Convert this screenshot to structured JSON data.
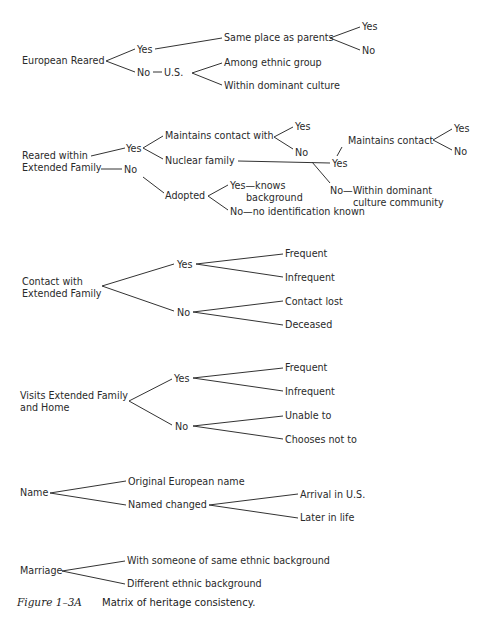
{
  "trees": {
    "european_reared": {
      "root": "European Reared",
      "yes": "Yes",
      "same_place": "Same place as parents",
      "same_place_yes": "Yes",
      "same_place_no": "No",
      "no": "No",
      "us": "U.S.",
      "among_ethnic": "Among ethnic group",
      "within_dominant": "Within dominant culture"
    },
    "extended_family": {
      "root_line1": "Reared  within",
      "root_line2": "Extended Family",
      "yes": "Yes",
      "maintains_contact_with": "Maintains contact with",
      "mcw_yes": "Yes",
      "mcw_no": "No",
      "nuclear_family": "Nuclear family",
      "nf_yes": "Yes",
      "maintains_contact": "Maintains contact",
      "mc_yes": "Yes",
      "mc_no": "No",
      "nf_no_line1": "No—Within dominant",
      "nf_no_line2": "culture community",
      "no": "No",
      "adopted": "Adopted",
      "adopted_yes_line1": "Yes—knows",
      "adopted_yes_line2": "background",
      "adopted_no": "No—no identification known"
    },
    "contact": {
      "root_line1": "Contact with",
      "root_line2": "Extended Family",
      "yes": "Yes",
      "frequent": "Frequent",
      "infrequent": "Infrequent",
      "no": "No",
      "contact_lost": "Contact lost",
      "deceased": "Deceased"
    },
    "visits": {
      "root_line1": "Visits Extended Family",
      "root_line2": "and Home",
      "yes": "Yes",
      "frequent": "Frequent",
      "infrequent": "Infrequent",
      "no": "No",
      "unable": "Unable to",
      "chooses_not": "Chooses not to"
    },
    "name": {
      "root": "Name",
      "original": "Original European name",
      "changed": "Named changed",
      "arrival": "Arrival in U.S.",
      "later": "Later in life"
    },
    "marriage": {
      "root": "Marriage",
      "same": "With someone of same ethnic background",
      "different": "Different ethnic background"
    }
  },
  "caption": {
    "label": "Figure 1–3A",
    "text": "Matrix of heritage consistency."
  }
}
